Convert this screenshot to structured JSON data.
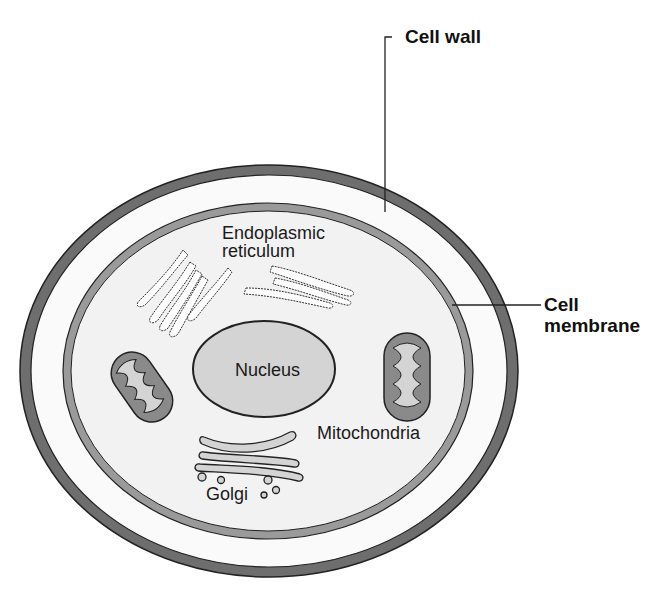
{
  "diagram": {
    "colors": {
      "cell_wall": "#6e6e6e",
      "cell_membrane": "#9a9a9a",
      "cytoplasm": "#f2f2f2",
      "wall_gap": "#fafafa",
      "organelle_fill": "#d4d4d4",
      "mitochondria_outer": "#8a8a8a",
      "outline": "#222222"
    },
    "labels": {
      "cell_wall": "Cell wall",
      "cell_membrane_line1": "Cell",
      "cell_membrane_line2": "membrane",
      "er_line1": "Endoplasmic",
      "er_line2": "reticulum",
      "nucleus": "Nucleus",
      "mitochondria": "Mitochondria",
      "golgi": "Golgi"
    }
  }
}
